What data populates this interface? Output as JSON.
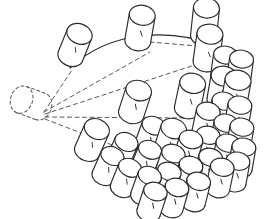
{
  "figure": {
    "background_color": "#ffffff",
    "stroke_color": "#2b2b2b",
    "ghost_stroke_color": "#555555",
    "construction_stroke_color": "#444444",
    "canvas": {
      "width": 277,
      "height": 219
    }
  },
  "apex": {
    "x": 43,
    "y": 113,
    "label": "fan-apex"
  },
  "ghost_cylinder": {
    "cx": 31,
    "cy": 103,
    "rx": 14,
    "ry": 11,
    "body_length": 20,
    "angle": -70,
    "style": "dashed"
  },
  "boundary_arc": {
    "style": "solid",
    "path": "M 70 68 C 110 30 170 28 218 46"
  },
  "construction_lines": [
    {
      "name": "radial-upper",
      "x1": 44,
      "y1": 112,
      "x2": 72,
      "y2": 70,
      "style": "dashed"
    },
    {
      "name": "radial-mid-upper",
      "x1": 44,
      "y1": 112,
      "x2": 150,
      "y2": 52,
      "style": "dashed"
    },
    {
      "name": "radial-mid",
      "x1": 45,
      "y1": 114,
      "x2": 210,
      "y2": 60,
      "style": "dashed"
    },
    {
      "name": "radial-mid-lower",
      "x1": 45,
      "y1": 117,
      "x2": 190,
      "y2": 118,
      "style": "dashed"
    },
    {
      "name": "radial-lower",
      "x1": 45,
      "y1": 119,
      "x2": 120,
      "y2": 148,
      "style": "dashed"
    },
    {
      "name": "arc-inner-dashed",
      "x1": 150,
      "y1": 42,
      "x2": 220,
      "y2": 48,
      "style": "dashed"
    }
  ],
  "cylinders": [
    {
      "id": "c01",
      "cx": 75,
      "cy": 45,
      "rx": 13,
      "ry": 10,
      "len": 24,
      "angle": 22,
      "ring": 1,
      "spoke": 1
    },
    {
      "id": "c02",
      "cx": 140,
      "cy": 28,
      "rx": 13,
      "ry": 10,
      "len": 26,
      "angle": 10,
      "ring": 1,
      "spoke": 3
    },
    {
      "id": "c03",
      "cx": 205,
      "cy": 22,
      "rx": 13,
      "ry": 10,
      "len": 28,
      "angle": 6,
      "ring": 1,
      "spoke": 5
    },
    {
      "id": "c04",
      "cx": 208,
      "cy": 48,
      "rx": 13,
      "ry": 10,
      "len": 28,
      "angle": 8,
      "ring": 2,
      "spoke": 5
    },
    {
      "id": "c05",
      "cx": 135,
      "cy": 102,
      "rx": 13,
      "ry": 10,
      "len": 24,
      "angle": 18,
      "ring": 3,
      "spoke": 3
    },
    {
      "id": "c06",
      "cx": 190,
      "cy": 96,
      "rx": 13,
      "ry": 10,
      "len": 26,
      "angle": 12,
      "ring": 3,
      "spoke": 4
    },
    {
      "id": "c07",
      "cx": 222,
      "cy": 88,
      "rx": 13,
      "ry": 10,
      "len": 24,
      "angle": 10,
      "ring": 3,
      "spoke": 5
    },
    {
      "id": "c08",
      "cx": 236,
      "cy": 92,
      "rx": 13,
      "ry": 10,
      "len": 24,
      "angle": 10,
      "ring": 3,
      "spoke": 6
    },
    {
      "id": "c09",
      "cx": 92,
      "cy": 140,
      "rx": 13,
      "ry": 10,
      "len": 24,
      "angle": 24,
      "ring": 4,
      "spoke": 2
    },
    {
      "id": "c10",
      "cx": 122,
      "cy": 152,
      "rx": 12,
      "ry": 9,
      "len": 22,
      "angle": 24,
      "ring": 4,
      "spoke": 2
    },
    {
      "id": "c11",
      "cx": 146,
      "cy": 160,
      "rx": 12,
      "ry": 9,
      "len": 22,
      "angle": 22,
      "ring": 4,
      "spoke": 3
    },
    {
      "id": "c12",
      "cx": 170,
      "cy": 140,
      "rx": 13,
      "ry": 10,
      "len": 24,
      "angle": 18,
      "ring": 4,
      "spoke": 3
    },
    {
      "id": "c13",
      "cx": 188,
      "cy": 150,
      "rx": 12,
      "ry": 9,
      "len": 22,
      "angle": 16,
      "ring": 4,
      "spoke": 4
    },
    {
      "id": "c14",
      "cx": 206,
      "cy": 122,
      "rx": 12,
      "ry": 9,
      "len": 22,
      "angle": 12,
      "ring": 4,
      "spoke": 4
    },
    {
      "id": "c15",
      "cx": 222,
      "cy": 112,
      "rx": 12,
      "ry": 9,
      "len": 22,
      "angle": 10,
      "ring": 4,
      "spoke": 5
    },
    {
      "id": "c16",
      "cx": 238,
      "cy": 116,
      "rx": 12,
      "ry": 9,
      "len": 22,
      "angle": 10,
      "ring": 4,
      "spoke": 6
    },
    {
      "id": "c17",
      "cx": 224,
      "cy": 134,
      "rx": 12,
      "ry": 9,
      "len": 22,
      "angle": 10,
      "ring": 5,
      "spoke": 5
    },
    {
      "id": "c18",
      "cx": 240,
      "cy": 138,
      "rx": 12,
      "ry": 9,
      "len": 22,
      "angle": 10,
      "ring": 5,
      "spoke": 6
    },
    {
      "id": "c19",
      "cx": 226,
      "cy": 154,
      "rx": 12,
      "ry": 9,
      "len": 22,
      "angle": 10,
      "ring": 6,
      "spoke": 5
    },
    {
      "id": "c20",
      "cx": 242,
      "cy": 158,
      "rx": 12,
      "ry": 9,
      "len": 22,
      "angle": 10,
      "ring": 6,
      "spoke": 6
    },
    {
      "id": "c21",
      "cx": 208,
      "cy": 168,
      "rx": 12,
      "ry": 9,
      "len": 22,
      "angle": 14,
      "ring": 6,
      "spoke": 4
    },
    {
      "id": "c22",
      "cx": 188,
      "cy": 176,
      "rx": 12,
      "ry": 9,
      "len": 22,
      "angle": 16,
      "ring": 6,
      "spoke": 4
    },
    {
      "id": "c23",
      "cx": 166,
      "cy": 182,
      "rx": 12,
      "ry": 9,
      "len": 22,
      "angle": 18,
      "ring": 6,
      "spoke": 3
    },
    {
      "id": "c24",
      "cx": 146,
      "cy": 186,
      "rx": 12,
      "ry": 9,
      "len": 22,
      "angle": 20,
      "ring": 6,
      "spoke": 3
    },
    {
      "id": "c25",
      "cx": 126,
      "cy": 178,
      "rx": 12,
      "ry": 9,
      "len": 22,
      "angle": 22,
      "ring": 5,
      "spoke": 2
    },
    {
      "id": "c26",
      "cx": 108,
      "cy": 166,
      "rx": 12,
      "ry": 9,
      "len": 22,
      "angle": 24,
      "ring": 5,
      "spoke": 2
    },
    {
      "id": "c27",
      "cx": 150,
      "cy": 136,
      "rx": 12,
      "ry": 9,
      "len": 22,
      "angle": 20,
      "ring": 4,
      "spoke": 3
    },
    {
      "id": "c28",
      "cx": 206,
      "cy": 146,
      "rx": 12,
      "ry": 9,
      "len": 22,
      "angle": 12,
      "ring": 5,
      "spoke": 4
    },
    {
      "id": "c29",
      "cx": 170,
      "cy": 164,
      "rx": 12,
      "ry": 9,
      "len": 22,
      "angle": 18,
      "ring": 5,
      "spoke": 3
    },
    {
      "id": "c30",
      "cx": 240,
      "cy": 70,
      "rx": 12,
      "ry": 9,
      "len": 22,
      "angle": 8,
      "ring": 2,
      "spoke": 6
    },
    {
      "id": "c31",
      "cx": 224,
      "cy": 66,
      "rx": 12,
      "ry": 9,
      "len": 22,
      "angle": 8,
      "ring": 2,
      "spoke": 5
    },
    {
      "id": "c32",
      "cx": 236,
      "cy": 172,
      "rx": 12,
      "ry": 9,
      "len": 22,
      "angle": 10,
      "ring": 7,
      "spoke": 6
    },
    {
      "id": "c33",
      "cx": 220,
      "cy": 178,
      "rx": 12,
      "ry": 9,
      "len": 22,
      "angle": 12,
      "ring": 7,
      "spoke": 5
    },
    {
      "id": "c34",
      "cx": 196,
      "cy": 192,
      "rx": 12,
      "ry": 9,
      "len": 22,
      "angle": 14,
      "ring": 7,
      "spoke": 4
    },
    {
      "id": "c35",
      "cx": 174,
      "cy": 198,
      "rx": 12,
      "ry": 9,
      "len": 22,
      "angle": 16,
      "ring": 7,
      "spoke": 3
    },
    {
      "id": "c36",
      "cx": 152,
      "cy": 202,
      "rx": 12,
      "ry": 9,
      "len": 22,
      "angle": 18,
      "ring": 7,
      "spoke": 3
    }
  ],
  "counts": {
    "cylinder_count": 36,
    "ghost_count": 1,
    "construction_line_count": 6
  }
}
